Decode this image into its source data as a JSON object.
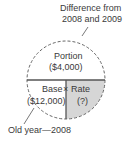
{
  "diagram": {
    "callout_top": {
      "line1": "Difference from",
      "line2": "2008 and 2009"
    },
    "portion": {
      "label": "Portion",
      "value": "($4,000)"
    },
    "base": {
      "label": "Base",
      "value": "($12,000)"
    },
    "operator": "×",
    "rate": {
      "label": "Rate",
      "value": "(?)"
    },
    "callout_bottom": "Old year—2008",
    "colors": {
      "rate_fill": "#d4d4d4",
      "line": "#555555"
    }
  }
}
